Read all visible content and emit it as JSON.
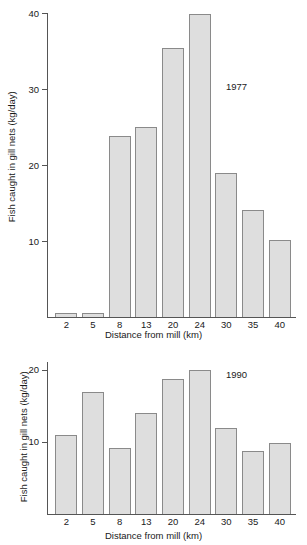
{
  "chart_data": [
    {
      "type": "bar",
      "title": "",
      "series_label": "1977",
      "xlabel": "Distance from mill (km)",
      "ylabel": "Fish caught in gill nets (kg/day)",
      "categories": [
        "2",
        "5",
        "8",
        "13",
        "20",
        "24",
        "30",
        "35",
        "40"
      ],
      "values": [
        0.5,
        0.5,
        23.8,
        25.0,
        35.4,
        39.9,
        19.0,
        14.1,
        10.1
      ],
      "ylim": [
        0,
        40
      ],
      "yticks": [
        10,
        20,
        30,
        40
      ],
      "ytick_labels": [
        "10",
        "20",
        "30",
        "40"
      ],
      "grid": false,
      "legend": "none",
      "bar_fill": "#dedede",
      "bar_stroke": "#8a8a8a"
    },
    {
      "type": "bar",
      "title": "",
      "series_label": "1990",
      "xlabel": "Distance from mill (km)",
      "ylabel": "Fish caught in gill nets (kg/day)",
      "categories": [
        "2",
        "5",
        "8",
        "13",
        "20",
        "24",
        "30",
        "35",
        "40"
      ],
      "values": [
        11.0,
        17.0,
        9.2,
        14.0,
        18.8,
        20.0,
        11.9,
        8.7,
        9.8
      ],
      "ylim": [
        0,
        21.1
      ],
      "yticks": [
        10,
        20
      ],
      "ytick_labels": [
        "10",
        "20"
      ],
      "grid": false,
      "legend": "none",
      "bar_fill": "#dedede",
      "bar_stroke": "#8a8a8a"
    }
  ],
  "cut_off_header": "                    "
}
